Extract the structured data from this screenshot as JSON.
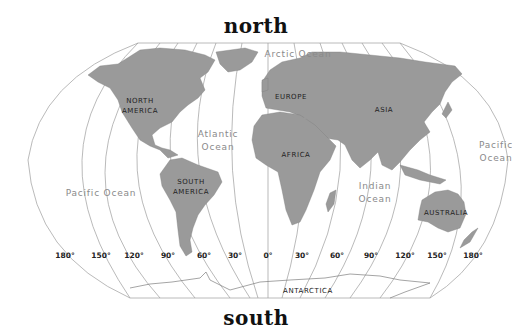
{
  "headings": {
    "north": "north",
    "south": "south"
  },
  "continents": [
    {
      "name": "NORTH",
      "x": 140,
      "y": 103
    },
    {
      "name": "AMERICA",
      "x": 140,
      "y": 113
    },
    {
      "name": "EUROPE",
      "x": 291,
      "y": 99
    },
    {
      "name": "ASIA",
      "x": 384,
      "y": 112
    },
    {
      "name": "AFRICA",
      "x": 296,
      "y": 157
    },
    {
      "name": "SOUTH",
      "x": 191,
      "y": 184
    },
    {
      "name": "AMERICA",
      "x": 191,
      "y": 194
    },
    {
      "name": "AUSTRALIA",
      "x": 446,
      "y": 215
    },
    {
      "name": "ANTARCTICA",
      "x": 308,
      "y": 293
    }
  ],
  "oceans": [
    {
      "name": "Arctic Ocean",
      "x": 298,
      "y": 57
    },
    {
      "name": "Atlantic",
      "x": 218,
      "y": 137
    },
    {
      "name": "Ocean",
      "x": 218,
      "y": 150
    },
    {
      "name": "Pacific Ocean",
      "x": 101,
      "y": 196
    },
    {
      "name": "Indian",
      "x": 375,
      "y": 189
    },
    {
      "name": "Ocean",
      "x": 375,
      "y": 202
    },
    {
      "name": "Pacific",
      "x": 496,
      "y": 148
    },
    {
      "name": "Ocean",
      "x": 496,
      "y": 161
    }
  ],
  "longitudes": [
    {
      "label": "180°",
      "x": 65
    },
    {
      "label": "150°",
      "x": 101
    },
    {
      "label": "120°",
      "x": 134
    },
    {
      "label": "90°",
      "x": 168
    },
    {
      "label": "60°",
      "x": 204
    },
    {
      "label": "30°",
      "x": 235
    },
    {
      "label": "0°",
      "x": 268
    },
    {
      "label": "30°",
      "x": 302
    },
    {
      "label": "60°",
      "x": 337
    },
    {
      "label": "90°",
      "x": 371
    },
    {
      "label": "120°",
      "x": 405
    },
    {
      "label": "150°",
      "x": 437
    },
    {
      "label": "180°",
      "x": 473
    }
  ],
  "colors": {
    "land": "#9a9a9a",
    "grid": "#9c9c9c",
    "ocean": "#ffffff",
    "outline": "#a8a8a8"
  }
}
